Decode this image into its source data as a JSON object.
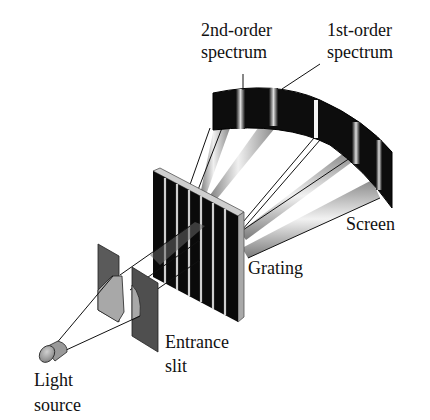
{
  "figure": {
    "labels": {
      "second_order": [
        "2nd-order",
        "spectrum"
      ],
      "first_order": [
        "1st-order",
        "spectrum"
      ],
      "screen": "Screen",
      "grating": "Grating",
      "entrance_slit": [
        "Entrance",
        "slit"
      ],
      "light_source": [
        "Light",
        "source"
      ]
    },
    "colors": {
      "screen": "#0d0d0d",
      "beam_light": "#e8e8e8",
      "beam_dark": "#8a8a8a",
      "grating_bar": "#0a0a0a",
      "grating_frame": "#bdbdbd",
      "slit_plate": "#5a5a5a",
      "light_patch": "#a8a8a8",
      "text": "#111111"
    }
  }
}
